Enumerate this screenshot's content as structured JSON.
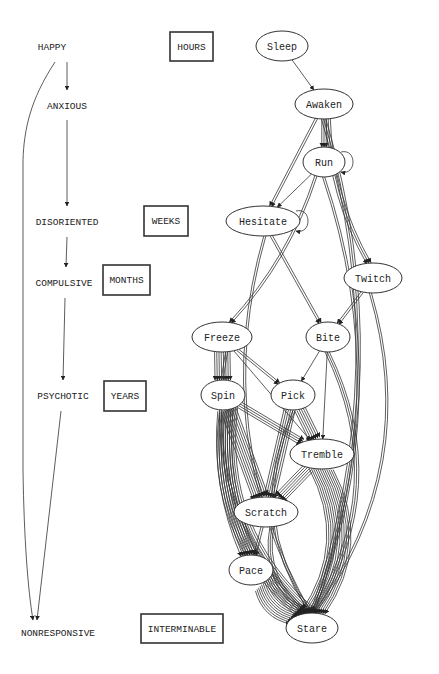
{
  "stages": [
    {
      "label": "HAPPY",
      "x": 52,
      "y": 47
    },
    {
      "label": "ANXIOUS",
      "x": 67,
      "y": 106
    },
    {
      "label": "DISORIENTED",
      "x": 67,
      "y": 222
    },
    {
      "label": "COMPULSIVE",
      "x": 64,
      "y": 283
    },
    {
      "label": "PSYCHOTIC",
      "x": 63,
      "y": 396
    },
    {
      "label": "NONRESPONSIVE",
      "x": 58,
      "y": 633
    }
  ],
  "durations": [
    {
      "label": "HOURS",
      "x": 170,
      "y": 32,
      "w": 43,
      "h": 29
    },
    {
      "label": "WEEKS",
      "x": 144,
      "y": 206,
      "w": 44,
      "h": 30
    },
    {
      "label": "MONTHS",
      "x": 103,
      "y": 265,
      "w": 47,
      "h": 30
    },
    {
      "label": "YEARS",
      "x": 104,
      "y": 381,
      "w": 42,
      "h": 30
    },
    {
      "label": "INTERMINABLE",
      "x": 141,
      "y": 614,
      "w": 82,
      "h": 29
    }
  ],
  "nodes": [
    {
      "id": "sleep",
      "label": "Sleep",
      "cx": 282,
      "cy": 46,
      "rx": 26,
      "ry": 15
    },
    {
      "id": "awaken",
      "label": "Awaken",
      "cx": 324,
      "cy": 104,
      "rx": 29,
      "ry": 15
    },
    {
      "id": "run",
      "label": "Run",
      "cx": 324,
      "cy": 162,
      "rx": 21,
      "ry": 15
    },
    {
      "id": "hesitate",
      "label": "Hesitate",
      "cx": 263,
      "cy": 221,
      "rx": 37,
      "ry": 15
    },
    {
      "id": "twitch",
      "label": "Twitch",
      "cx": 373,
      "cy": 278,
      "rx": 29,
      "ry": 15
    },
    {
      "id": "freeze",
      "label": "Freeze",
      "cx": 222,
      "cy": 337,
      "rx": 30,
      "ry": 15
    },
    {
      "id": "bite",
      "label": "Bite",
      "cx": 328,
      "cy": 337,
      "rx": 22,
      "ry": 15
    },
    {
      "id": "spin",
      "label": "Spin",
      "cx": 223,
      "cy": 395,
      "rx": 22,
      "ry": 15
    },
    {
      "id": "pick",
      "label": "Pick",
      "cx": 293,
      "cy": 395,
      "rx": 22,
      "ry": 15
    },
    {
      "id": "tremble",
      "label": "Tremble",
      "cx": 322,
      "cy": 454,
      "rx": 32,
      "ry": 15
    },
    {
      "id": "scratch",
      "label": "Scratch",
      "cx": 266,
      "cy": 512,
      "rx": 32,
      "ry": 15
    },
    {
      "id": "pace",
      "label": "Pace",
      "cx": 251,
      "cy": 570,
      "rx": 22,
      "ry": 15
    },
    {
      "id": "stare",
      "label": "Stare",
      "cx": 312,
      "cy": 628,
      "rx": 26,
      "ry": 15
    }
  ],
  "edges": [
    {
      "from": "sleep",
      "to": "awaken",
      "count": 1
    },
    {
      "from": "awaken",
      "to": "run",
      "count": 3
    },
    {
      "from": "run",
      "to": "run",
      "count": 1
    },
    {
      "from": "awaken",
      "to": "hesitate",
      "count": 2
    },
    {
      "from": "run",
      "to": "hesitate",
      "count": 1
    },
    {
      "from": "hesitate",
      "to": "hesitate",
      "count": 1
    },
    {
      "from": "awaken",
      "to": "twitch",
      "count": 3
    },
    {
      "from": "awaken",
      "to": "stare",
      "count": 3
    },
    {
      "from": "run",
      "to": "freeze",
      "count": 2
    },
    {
      "from": "hesitate",
      "to": "bite",
      "count": 2
    },
    {
      "from": "twitch",
      "to": "bite",
      "count": 2
    },
    {
      "from": "hesitate",
      "to": "stare",
      "count": 2
    },
    {
      "from": "run",
      "to": "stare",
      "count": 2
    },
    {
      "from": "twitch",
      "to": "stare",
      "count": 2
    },
    {
      "from": "freeze",
      "to": "spin",
      "count": 8
    },
    {
      "from": "freeze",
      "to": "pick",
      "count": 2
    },
    {
      "from": "freeze",
      "to": "tremble",
      "count": 1
    },
    {
      "from": "bite",
      "to": "pick",
      "count": 1
    },
    {
      "from": "bite",
      "to": "tremble",
      "count": 1
    },
    {
      "from": "bite",
      "to": "stare",
      "count": 3
    },
    {
      "from": "freeze",
      "to": "stare",
      "count": 2
    },
    {
      "from": "spin",
      "to": "tremble",
      "count": 4
    },
    {
      "from": "spin",
      "to": "scratch",
      "count": 8
    },
    {
      "from": "spin",
      "to": "stare",
      "count": 10
    },
    {
      "from": "pick",
      "to": "tremble",
      "count": 6
    },
    {
      "from": "pick",
      "to": "scratch",
      "count": 6
    },
    {
      "from": "pick",
      "to": "stare",
      "count": 2
    },
    {
      "from": "tremble",
      "to": "scratch",
      "count": 6
    },
    {
      "from": "tremble",
      "to": "stare",
      "count": 12
    },
    {
      "from": "scratch",
      "to": "pace",
      "count": 2
    },
    {
      "from": "scratch",
      "to": "stare",
      "count": 3
    },
    {
      "from": "pace",
      "to": "stare",
      "count": 12
    },
    {
      "from": "spin",
      "to": "pace",
      "count": 8
    }
  ]
}
